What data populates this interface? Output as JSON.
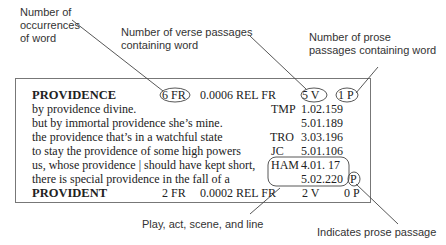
{
  "annotations": {
    "occurrences": [
      "Number of",
      "occurrences",
      "of  word"
    ],
    "verse": [
      "Number of verse passages",
      "containing word"
    ],
    "prose_count": [
      "Number of prose",
      "passages containing word"
    ],
    "play_ref": "Play, act, scene, and line",
    "prose_indicator": "Indicates prose passage"
  },
  "entry": {
    "headword": "PROVIDENCE",
    "freq": "6 FR",
    "rel_freq": "0.0006 REL FR",
    "verse_count": "5 V",
    "prose_count": "1 P",
    "lines": [
      {
        "text": "by providence divine.",
        "play": "TMP",
        "ref": "1.02.159"
      },
      {
        "text": "but by immortal providence she’s mine.",
        "play": "",
        "ref": "5.01.189"
      },
      {
        "text": "the providence that’s in a watchful state",
        "play": "TRO",
        "ref": "3.03.196"
      },
      {
        "text": "to stay the providence of some high powers",
        "play": "JC",
        "ref": "5.01.106"
      },
      {
        "text": "us, whose providence | should have kept short,",
        "play": "HAM",
        "ref": "4.01. 17"
      },
      {
        "text": "there is special providence in the fall of a",
        "play": "",
        "ref": "5.02.220",
        "prose_mark": "P"
      }
    ]
  },
  "next_entry": {
    "headword": "PROVIDENT",
    "freq": "2 FR",
    "rel_freq": "0.0002 REL FR",
    "verse_count": "2 V",
    "prose_count": "0 P"
  }
}
